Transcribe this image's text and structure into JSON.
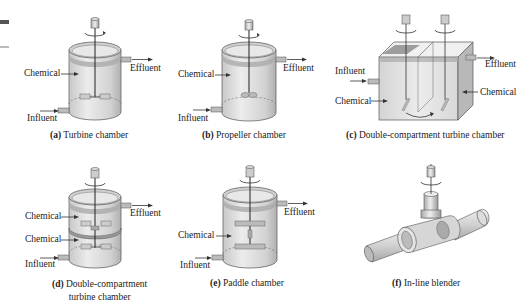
{
  "figure": {
    "panels": [
      {
        "id": "a",
        "caption_letter": "(a)",
        "caption_text": "Turbine chamber",
        "labels": {
          "chemical": "Chemical",
          "effluent": "Effluent",
          "influent": "Influent"
        }
      },
      {
        "id": "b",
        "caption_letter": "(b)",
        "caption_text": "Propeller chamber",
        "labels": {
          "chemical": "Chemical",
          "effluent": "Effluent",
          "influent": "Influent"
        }
      },
      {
        "id": "c",
        "caption_letter": "(c)",
        "caption_text": "Double-compartment turbine chamber",
        "labels": {
          "influent": "Influent",
          "chemical_left": "Chemical",
          "chemical_right": "Chemical",
          "effluent": "Effluent"
        }
      },
      {
        "id": "d",
        "caption_letter": "(d)",
        "caption_text": "Double-compartment",
        "caption_text_line2": "turbine chamber",
        "labels": {
          "chemical_top": "Chemical",
          "chemical_bottom": "Chemical",
          "effluent": "Effluent",
          "influent": "Influent"
        }
      },
      {
        "id": "e",
        "caption_letter": "(e)",
        "caption_text": "Paddle chamber",
        "labels": {
          "chemical": "Chemical",
          "effluent": "Effluent",
          "influent": "Influent"
        }
      },
      {
        "id": "f",
        "caption_letter": "(f)",
        "caption_text": "In-line blender",
        "labels": {}
      }
    ]
  },
  "colors": {
    "tank_fill": "#d9d9d9",
    "tank_dark": "#a8a8a8",
    "tank_rim": "#9a9a9a",
    "line": "#333333"
  }
}
